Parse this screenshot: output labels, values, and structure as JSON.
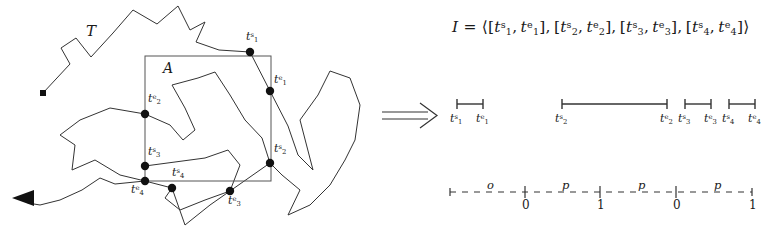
{
  "figure": {
    "background": "#ffffff",
    "ink": "#1a1a1a",
    "trajectory_label": "T",
    "region_label": "A",
    "implication_symbol": "⟹",
    "start_marker": "square",
    "end_marker": "arrowhead-left"
  },
  "crossing_points": [
    {
      "id": "t1s",
      "t": "t",
      "sub": "1",
      "sup": "s",
      "x": 250,
      "y": 52,
      "label_x": 246,
      "label_y": 30
    },
    {
      "id": "t1e",
      "t": "t",
      "sub": "1",
      "sup": "e",
      "x": 270,
      "y": 91,
      "label_x": 274,
      "label_y": 73
    },
    {
      "id": "t2e",
      "t": "t",
      "sub": "2",
      "sup": "e",
      "x": 145,
      "y": 114,
      "label_x": 148,
      "label_y": 92
    },
    {
      "id": "t2s",
      "t": "t",
      "sub": "2",
      "sup": "s",
      "x": 270,
      "y": 163,
      "label_x": 274,
      "label_y": 142
    },
    {
      "id": "t3s",
      "t": "t",
      "sub": "3",
      "sup": "s",
      "x": 145,
      "y": 166,
      "label_x": 148,
      "label_y": 145
    },
    {
      "id": "t4e",
      "t": "t",
      "sub": "4",
      "sup": "e",
      "x": 145,
      "y": 181,
      "label_x": 131,
      "label_y": 183
    },
    {
      "id": "t4s",
      "t": "t",
      "sub": "4",
      "sup": "s",
      "x": 172,
      "y": 188,
      "label_x": 172,
      "label_y": 166
    },
    {
      "id": "t3e",
      "t": "t",
      "sub": "3",
      "sup": "e",
      "x": 230,
      "y": 191,
      "label_x": 228,
      "label_y": 194
    }
  ],
  "region_rect": {
    "x": 145,
    "y": 56,
    "w": 126,
    "h": 125
  },
  "formula": {
    "lhs": "I",
    "equals": "=",
    "open": "⟨",
    "close": "⟩",
    "intervals": [
      {
        "start": {
          "t": "t",
          "sub": "1",
          "sup": "s"
        },
        "end": {
          "t": "t",
          "sub": "1",
          "sup": "e"
        }
      },
      {
        "start": {
          "t": "t",
          "sub": "2",
          "sup": "s"
        },
        "end": {
          "t": "t",
          "sub": "2",
          "sup": "e"
        }
      },
      {
        "start": {
          "t": "t",
          "sub": "3",
          "sup": "s"
        },
        "end": {
          "t": "t",
          "sub": "3",
          "sup": "e"
        }
      },
      {
        "start": {
          "t": "t",
          "sub": "4",
          "sup": "s"
        },
        "end": {
          "t": "t",
          "sub": "4",
          "sup": "e"
        }
      }
    ]
  },
  "interval_bars": [
    {
      "id": "bar-1",
      "x1": 457,
      "x2": 483,
      "y": 104,
      "start_label": {
        "t": "t",
        "sub": "1",
        "sup": "s"
      },
      "end_label": {
        "t": "t",
        "sub": "1",
        "sup": "e"
      },
      "start_label_x": 450,
      "end_label_x": 476,
      "label_y": 112
    },
    {
      "id": "bar-2",
      "x1": 562,
      "x2": 667,
      "y": 104,
      "start_label": {
        "t": "t",
        "sub": "2",
        "sup": "s"
      },
      "end_label": {
        "t": "t",
        "sub": "2",
        "sup": "e"
      },
      "start_label_x": 555,
      "end_label_x": 660,
      "label_y": 112
    },
    {
      "id": "bar-3",
      "x1": 685,
      "x2": 711,
      "y": 104,
      "start_label": {
        "t": "t",
        "sub": "3",
        "sup": "s"
      },
      "end_label": {
        "t": "t",
        "sub": "3",
        "sup": "e"
      },
      "start_label_x": 678,
      "end_label_x": 704,
      "label_y": 112
    },
    {
      "id": "bar-4",
      "x1": 729,
      "x2": 755,
      "y": 104,
      "start_label": {
        "t": "t",
        "sub": "4",
        "sup": "s"
      },
      "end_label": {
        "t": "t",
        "sub": "4",
        "sup": "e"
      },
      "start_label_x": 722,
      "end_label_x": 748,
      "label_y": 112
    }
  ],
  "timeline": {
    "y": 192,
    "x_start": 450,
    "x_end": 752,
    "ticks": [
      {
        "kind": "half",
        "x": 450,
        "number": ""
      },
      {
        "kind": "plus",
        "x": 525,
        "number": "0"
      },
      {
        "kind": "plus",
        "x": 600,
        "number": "1"
      },
      {
        "kind": "plus",
        "x": 676,
        "number": "0"
      },
      {
        "kind": "half-end",
        "x": 752,
        "number": "1"
      }
    ],
    "segment_labels": [
      {
        "text": "o",
        "x": 487,
        "y": 178
      },
      {
        "text": "p",
        "x": 562,
        "y": 178
      },
      {
        "text": "p",
        "x": 638,
        "y": 178
      },
      {
        "text": "p",
        "x": 714,
        "y": 178
      }
    ]
  }
}
